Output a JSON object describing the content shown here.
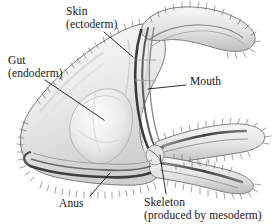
{
  "figure": {
    "kind": "biological-anatomy-diagram",
    "style": "grayscale pencil illustration",
    "background_color": "#ffffff",
    "ink_color": "#151515",
    "shading_colors": {
      "body_light": "#f2f2f2",
      "body_mid": "#d9d9d9",
      "body_dark": "#9a9a9a",
      "tube_dark": "#4a4a4a",
      "outline": "#6b6b6b"
    }
  },
  "labels": {
    "skin": {
      "line1": "Skin",
      "line2": "(ectoderm)"
    },
    "gut": {
      "line1": "Gut",
      "line2": "(endoderm)"
    },
    "mouth": {
      "line1": "Mouth"
    },
    "anus": {
      "line1": "Anus"
    },
    "skeleton": {
      "line1": "Skeleton",
      "line2": "(produced by mesoderm)"
    }
  },
  "leader_lines": {
    "skin": {
      "from": [
        104,
        32
      ],
      "to": [
        133,
        57
      ]
    },
    "gut": {
      "from": [
        45,
        80
      ],
      "to": [
        104,
        120
      ]
    },
    "mouth": {
      "from": [
        186,
        85
      ],
      "to": [
        148,
        89
      ]
    },
    "anus": {
      "from": [
        90,
        196
      ],
      "to": [
        110,
        173
      ]
    },
    "skeleton": {
      "from": [
        166,
        194
      ],
      "to": [
        160,
        155
      ]
    }
  }
}
